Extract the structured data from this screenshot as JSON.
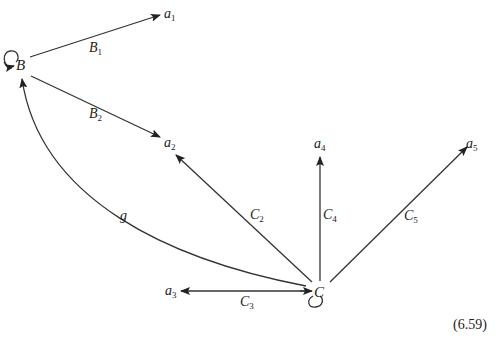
{
  "nodes": {
    "B": {
      "label": "B"
    },
    "C": {
      "label": "C"
    },
    "a1": {
      "base": "a",
      "sub": "1"
    },
    "a2": {
      "base": "a",
      "sub": "2"
    },
    "a3": {
      "base": "a",
      "sub": "3"
    },
    "a4": {
      "base": "a",
      "sub": "4"
    },
    "a5": {
      "base": "a",
      "sub": "5"
    }
  },
  "edges": {
    "B1": {
      "base": "B",
      "sub": "1",
      "from": "B",
      "to": "a1"
    },
    "B2": {
      "base": "B",
      "sub": "2",
      "from": "B",
      "to": "a2"
    },
    "C2": {
      "base": "C",
      "sub": "2",
      "from": "C",
      "to": "a2"
    },
    "C3": {
      "base": "C",
      "sub": "3",
      "from": "C",
      "to": "a3"
    },
    "C4": {
      "base": "C",
      "sub": "4",
      "from": "C",
      "to": "a4"
    },
    "C5": {
      "base": "C",
      "sub": "5",
      "from": "C",
      "to": "a5"
    },
    "g": {
      "label": "g",
      "from": "C",
      "to": "B"
    }
  },
  "loops": [
    "B",
    "C"
  ],
  "equation_number": "(6.59)",
  "colors": {
    "stroke": "#222222",
    "background": "#ffffff"
  }
}
